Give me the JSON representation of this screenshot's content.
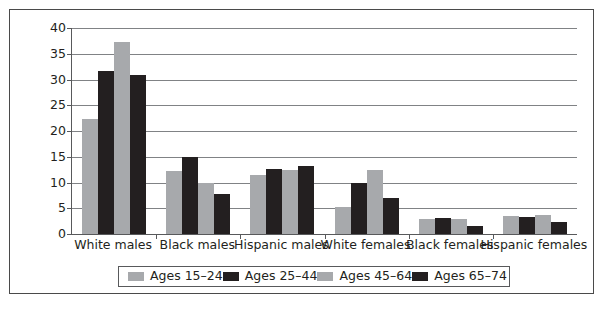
{
  "chart_data": {
    "type": "bar",
    "title": "",
    "subtitle": "",
    "xlabel": "",
    "ylabel": "",
    "ylim": [
      0,
      40
    ],
    "y_ticks": [
      0,
      5,
      10,
      15,
      20,
      25,
      30,
      35,
      40
    ],
    "y_tick_labels": [
      "0",
      "5",
      "10",
      "15",
      "20",
      "25",
      "30",
      "35",
      "40"
    ],
    "grid": true,
    "legend_position": "bottom",
    "categories": [
      "White males",
      "Black males",
      "Hispanic males",
      "White females",
      "Black females",
      "Hispanic females"
    ],
    "series": [
      {
        "name": "Ages 15–24",
        "color": "#a7a9ac",
        "values": [
          22.4,
          12.3,
          11.5,
          5.3,
          3.0,
          3.5
        ]
      },
      {
        "name": "Ages 25–44",
        "color": "#231f20",
        "values": [
          31.7,
          15.0,
          12.6,
          10.0,
          3.1,
          3.3
        ]
      },
      {
        "name": "Ages 45–64",
        "color": "#a7a9ac",
        "values": [
          37.2,
          10.0,
          12.5,
          12.5,
          2.9,
          3.6
        ]
      },
      {
        "name": "Ages 65–74",
        "color": "#231f20",
        "values": [
          30.8,
          7.7,
          13.3,
          7.0,
          1.6,
          2.4
        ]
      }
    ]
  },
  "legend": {
    "items": [
      {
        "label": "Ages 15–24",
        "color": "#a7a9ac"
      },
      {
        "label": "Ages 25–44",
        "color": "#231f20"
      },
      {
        "label": "Ages 45–64",
        "color": "#a7a9ac"
      },
      {
        "label": "Ages 65–74",
        "color": "#231f20"
      }
    ]
  },
  "axes": {
    "y_tick_labels": [
      "40",
      "35",
      "30",
      "25",
      "20",
      "15",
      "10",
      "5",
      "0"
    ],
    "x_tick_labels": [
      "White males",
      "Black males",
      "Hispanic males",
      "White females",
      "Black females",
      "Hispanic females"
    ]
  }
}
